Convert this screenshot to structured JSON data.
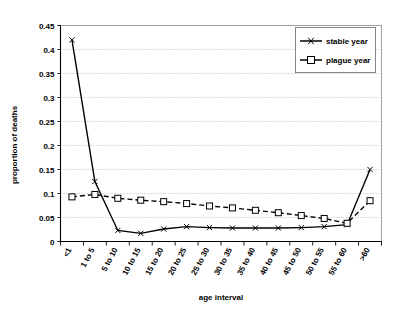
{
  "chart_data": {
    "type": "line",
    "title": "",
    "xlabel": "age interval",
    "ylabel": "proportion of deaths",
    "categories": [
      "<1",
      "1 to 5",
      "5 to 10",
      "10 to 15",
      "15 to 20",
      "20 to 25",
      "25 to 30",
      "30 to 35",
      "35 to 40",
      "40 to 45",
      "45 to 50",
      "50 to 55",
      "55 to 60",
      ">60"
    ],
    "series": [
      {
        "name": "stable year",
        "marker": "cross",
        "line_style": "solid",
        "values": [
          0.42,
          0.125,
          0.023,
          0.017,
          0.026,
          0.031,
          0.029,
          0.028,
          0.028,
          0.028,
          0.029,
          0.031,
          0.035,
          0.15
        ]
      },
      {
        "name": "plague year",
        "marker": "open-square",
        "line_style": "dashed",
        "values": [
          0.093,
          0.098,
          0.09,
          0.086,
          0.083,
          0.079,
          0.074,
          0.07,
          0.065,
          0.06,
          0.054,
          0.048,
          0.038,
          0.085
        ]
      }
    ],
    "ylim": [
      0,
      0.45
    ],
    "ytick_step": 0.05,
    "ytick_labels": [
      "0",
      "0.05",
      "0.1",
      "0.15",
      "0.2",
      "0.25",
      "0.3",
      "0.35",
      "0.4",
      "0.45"
    ],
    "grid": true,
    "grid_axis": "y",
    "legend_position": "top-right"
  },
  "legend": {
    "entries": [
      {
        "label": "stable year"
      },
      {
        "label": "plague year"
      }
    ]
  },
  "colors": {
    "line": "#000000",
    "grid": "#9a9a9a",
    "background": "#ffffff",
    "legend_border": "#7a7a7a"
  }
}
